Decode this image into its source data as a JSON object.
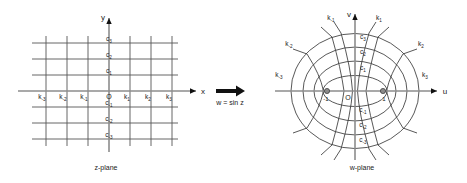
{
  "figure": {
    "mapping_label": "w = sin z",
    "arrow_icon": "right-arrow-icon"
  },
  "z_plane": {
    "caption": "z-plane",
    "x_axis_label": "x",
    "y_axis_label": "y",
    "origin_label": "O",
    "vertical_line_labels": [
      "k",
      "k",
      "k",
      "k",
      "k",
      "k"
    ],
    "vertical_line_subscripts": [
      "-3",
      "-2",
      "-1",
      "1",
      "2",
      "3"
    ],
    "horizontal_line_labels": [
      "c",
      "c",
      "c",
      "c",
      "c",
      "c"
    ],
    "horizontal_line_subscripts": [
      "3",
      "2",
      "1",
      "-1",
      "-2",
      "-3"
    ],
    "k_labels": [
      {
        "base": "k",
        "sub": "-3"
      },
      {
        "base": "k",
        "sub": "-2"
      },
      {
        "base": "k",
        "sub": "-1"
      },
      {
        "base": "k",
        "sub": "1"
      },
      {
        "base": "k",
        "sub": "2"
      },
      {
        "base": "k",
        "sub": "3"
      }
    ],
    "c_labels": [
      {
        "base": "c",
        "sub": "3"
      },
      {
        "base": "c",
        "sub": "2"
      },
      {
        "base": "c",
        "sub": "1"
      },
      {
        "base": "c",
        "sub": "-1"
      },
      {
        "base": "c",
        "sub": "-2"
      },
      {
        "base": "c",
        "sub": "-3"
      }
    ]
  },
  "w_plane": {
    "caption": "w-plane",
    "u_axis_label": "u",
    "v_axis_label": "v",
    "origin_label": "O",
    "focus_left_label": "-1",
    "focus_right_label": "1",
    "k_labels_left": [
      {
        "base": "k",
        "sub": "-1"
      },
      {
        "base": "k",
        "sub": "-2"
      },
      {
        "base": "k",
        "sub": "-3"
      }
    ],
    "k_labels_right": [
      {
        "base": "k",
        "sub": "1"
      },
      {
        "base": "k",
        "sub": "2"
      },
      {
        "base": "k",
        "sub": "3"
      }
    ],
    "c_labels": [
      {
        "base": "c",
        "sub": "3"
      },
      {
        "base": "c",
        "sub": "2"
      },
      {
        "base": "c",
        "sub": "1"
      },
      {
        "base": "c",
        "sub": "-1"
      },
      {
        "base": "c",
        "sub": "-2"
      },
      {
        "base": "c",
        "sub": "-3"
      }
    ]
  },
  "colors": {
    "gridline": "#555555",
    "axisline": "#8c8c8c",
    "curveline": "#3a3a3a",
    "text": "#222222",
    "background": "#ffffff"
  }
}
